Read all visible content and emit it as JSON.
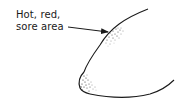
{
  "diagram": {
    "label": {
      "line1": "Hot, red,",
      "line2": "sore area"
    },
    "colors": {
      "ink": "#1a1a1a",
      "background": "#ffffff"
    }
  }
}
